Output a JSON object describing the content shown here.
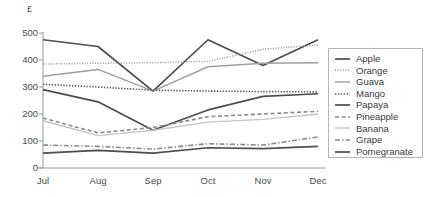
{
  "chart_data": {
    "type": "line",
    "title": "",
    "xlabel": "",
    "ylabel": "£",
    "unit_label": "£",
    "categories": [
      "Jul",
      "Aug",
      "Sep",
      "Oct",
      "Nov",
      "Dec"
    ],
    "ylim": [
      0,
      500
    ],
    "yticks": [
      0,
      100,
      200,
      300,
      400,
      500
    ],
    "ytick_labels": [
      "0",
      "100",
      "200",
      "300",
      "400",
      "500"
    ],
    "grid": false,
    "legend_position": "right",
    "series": [
      {
        "name": "Apple",
        "values": [
          475,
          450,
          285,
          475,
          380,
          475
        ],
        "color": "#4d4d4d",
        "style": "solid",
        "width": 1.7
      },
      {
        "name": "Orange",
        "values": [
          385,
          388,
          390,
          395,
          440,
          455
        ],
        "color": "#9a9a9a",
        "style": "fine-dotted",
        "width": 1.5
      },
      {
        "name": "Guava",
        "values": [
          340,
          365,
          285,
          375,
          388,
          390
        ],
        "color": "#9e9e9e",
        "style": "solid",
        "width": 1.4
      },
      {
        "name": "Mango",
        "values": [
          310,
          300,
          288,
          285,
          283,
          282
        ],
        "color": "#5a5a5a",
        "style": "dotted",
        "width": 1.6
      },
      {
        "name": "Papaya",
        "values": [
          290,
          245,
          140,
          215,
          265,
          275
        ],
        "color": "#4d4d4d",
        "style": "solid",
        "width": 1.7
      },
      {
        "name": "Pineapple",
        "values": [
          185,
          130,
          150,
          190,
          200,
          210
        ],
        "color": "#8a8a8a",
        "style": "dashed",
        "width": 1.6
      },
      {
        "name": "Banana",
        "values": [
          175,
          120,
          140,
          170,
          180,
          200
        ],
        "color": "#c4c4c4",
        "style": "solid",
        "width": 1.4
      },
      {
        "name": "Grape",
        "values": [
          85,
          80,
          70,
          90,
          85,
          115
        ],
        "color": "#8a8a8a",
        "style": "dash-dot",
        "width": 1.6
      },
      {
        "name": "Pomegranate",
        "values": [
          55,
          65,
          55,
          75,
          72,
          80
        ],
        "color": "#4d4d4d",
        "style": "solid",
        "width": 1.7
      }
    ]
  },
  "axis": {
    "line_color": "#9a9a9a",
    "tick_color": "#9a9a9a"
  }
}
